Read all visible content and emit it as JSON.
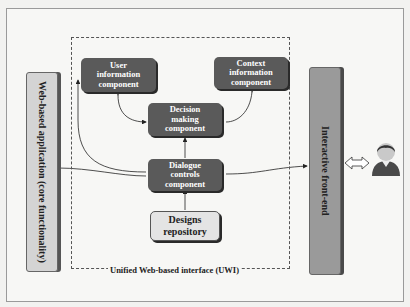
{
  "diagram": {
    "uwi_label": "Unified Web-based interface (UWI)",
    "left_bar": "Web-based application (core functionality)",
    "right_bar": "Interactive front-end",
    "components": {
      "user_info": [
        "User",
        "information",
        "component"
      ],
      "context_info": [
        "Context",
        "information",
        "component"
      ],
      "decision": [
        "Decision",
        "making",
        "component"
      ],
      "dialogue": [
        "Dialogue",
        "controls",
        "component"
      ],
      "designs": [
        "Designs",
        "repository"
      ]
    },
    "icons": {
      "bidirectional_arrow": "double-arrow-icon",
      "user": "user-avatar-icon"
    },
    "colors": {
      "dark_box": "#5a5a5a",
      "light_box": "#e4e4e4",
      "left_bar": "#d4d4d4",
      "right_bar": "#9a9a9a"
    }
  }
}
